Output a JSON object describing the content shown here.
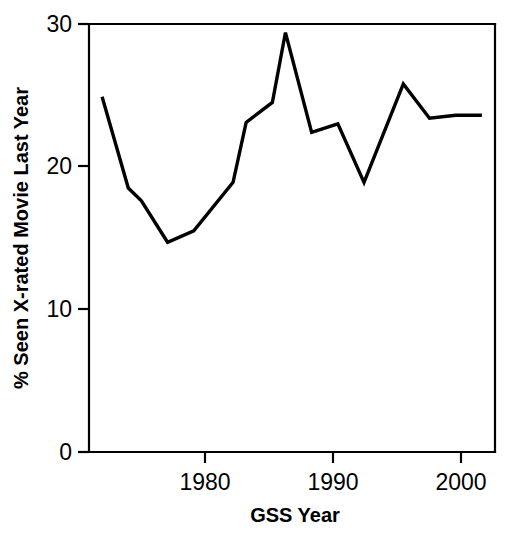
{
  "chart_data": {
    "type": "line",
    "title": "",
    "xlabel": "GSS Year",
    "ylabel": "% Seen X-rated Movie Last Year",
    "xlim": [
      1972.0,
      2003.0
    ],
    "ylim": [
      0,
      30
    ],
    "xticks": [
      1980,
      1990,
      2000
    ],
    "xtick_labels": [
      "1980",
      "1990",
      "2000"
    ],
    "yticks": [
      0,
      10,
      20,
      30
    ],
    "ytick_labels": [
      "0",
      "10",
      "20",
      "30"
    ],
    "grid": false,
    "legend": null,
    "line_color": "#000000",
    "background_color": "#ffffff",
    "x": [
      1973,
      1975,
      1976,
      1978,
      1980,
      1983,
      1984,
      1986,
      1987,
      1989,
      1991,
      1993,
      1996,
      1998,
      2000,
      2002
    ],
    "values": [
      24.9,
      18.5,
      17.6,
      14.7,
      15.5,
      18.9,
      23.1,
      24.5,
      29.4,
      22.4,
      23.0,
      18.9,
      25.8,
      23.4,
      23.6,
      23.6
    ],
    "series": [
      {
        "name": "% Seen X-rated Movie Last Year",
        "x": [
          1973,
          1975,
          1976,
          1978,
          1980,
          1983,
          1984,
          1986,
          1987,
          1989,
          1991,
          1993,
          1996,
          1998,
          2000,
          2002
        ],
        "values": [
          24.9,
          18.5,
          17.6,
          14.7,
          15.5,
          18.9,
          23.1,
          24.5,
          29.4,
          22.4,
          23.0,
          18.9,
          25.8,
          23.4,
          23.6,
          23.6
        ]
      }
    ]
  },
  "axes": {
    "y_tick_0": "0",
    "y_tick_10": "10",
    "y_tick_20": "20",
    "y_tick_30": "30",
    "x_tick_1980": "1980",
    "x_tick_1990": "1990",
    "x_tick_2000": "2000",
    "x_axis_title": "GSS Year",
    "y_axis_title": "% Seen X-rated Movie Last Year"
  }
}
